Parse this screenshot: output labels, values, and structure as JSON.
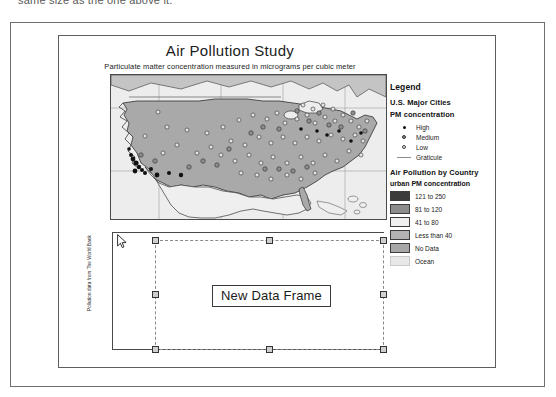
{
  "document": {
    "top_instruction_text": "same size as the one above it.",
    "side_credit": "Pollution data from The World Bank"
  },
  "map_layout": {
    "title": "Air Pollution Study",
    "subtitle": "Particulate matter concentration measured in micrograms per cubic meter"
  },
  "legend": {
    "heading": "Legend",
    "cities_heading": "U.S. Major Cities",
    "pm_heading": "PM concentration",
    "point_classes": [
      {
        "label": "High",
        "symbol": "filled-dot",
        "color": "#111111"
      },
      {
        "label": "Medium",
        "symbol": "medium-dot",
        "color": "#8e8e8e"
      },
      {
        "label": "Low",
        "symbol": "hollow-dot",
        "color": "#e2e2e2"
      },
      {
        "label": "Graticule",
        "symbol": "line",
        "color": "#8a8a8a"
      }
    ],
    "country_heading": "Air Pollution by Country",
    "country_sub_heading": "urban PM concentration",
    "country_classes": [
      {
        "label": "121 to 250",
        "color": "#3b3b3b"
      },
      {
        "label": "81 to 120",
        "color": "#8c8c8c"
      },
      {
        "label": "41 to 80",
        "color": "#f0f0f0"
      },
      {
        "label": "Less than 40",
        "color": "#b3b3b3"
      },
      {
        "label": "No Data",
        "color": "#a8a8a8"
      },
      {
        "label": "Ocean",
        "color": "#e8e8e8"
      }
    ]
  },
  "data_frame": {
    "label": "New Data Frame",
    "selected": true,
    "handle_count": 8
  },
  "colors": {
    "land": "#b0b0b0",
    "ocean": "#ededed",
    "border": "#4a4a4a",
    "selection": "#8a8a8a",
    "handle_fill": "#cfcfcf"
  },
  "icons": {
    "cursor": "arrow-cursor"
  }
}
